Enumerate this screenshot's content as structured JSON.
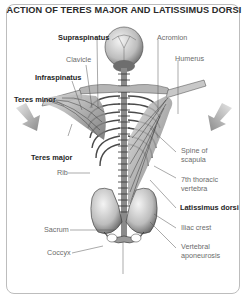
{
  "title": "ACTION OF TERES MAJOR AND LATISSIMUS DORSI",
  "labels": {
    "supraspinatus": "Supraspinatus",
    "clavicle": "Clavicle",
    "infraspinatus": "Infraspinatus",
    "teres_minor": "Teres minor",
    "teres_major": "Teres major",
    "rib": "Rib",
    "sacrum": "Sacrum",
    "coccyx": "Coccyx",
    "acromion": "Acromion",
    "humerus": "Humerus",
    "spine_of_scapula_1": "Spine of",
    "spine_of_scapula_2": "scapula",
    "thoracic_vertebra_1": "7th thoracic",
    "thoracic_vertebra_2": "vertebra",
    "latissimus_dorsi": "Latissimus dorsi",
    "iliac_crest": "Iliac crest",
    "vertebral_aponeurosis_1": "Vertebral",
    "vertebral_aponeurosis_2": "aponeurosis"
  },
  "arrows": [
    {
      "side": "left",
      "direction": "down-right",
      "icon": "arrow-down-icon"
    },
    {
      "side": "right",
      "direction": "down-left",
      "icon": "arrow-down-icon"
    }
  ],
  "colors": {
    "frame": "#bdbdbd",
    "title": "#2a2a2a",
    "bold_label": "#1e1e1e",
    "label": "#6b6b6b",
    "leader": "#555555",
    "arrow": "#9a9a9a"
  }
}
